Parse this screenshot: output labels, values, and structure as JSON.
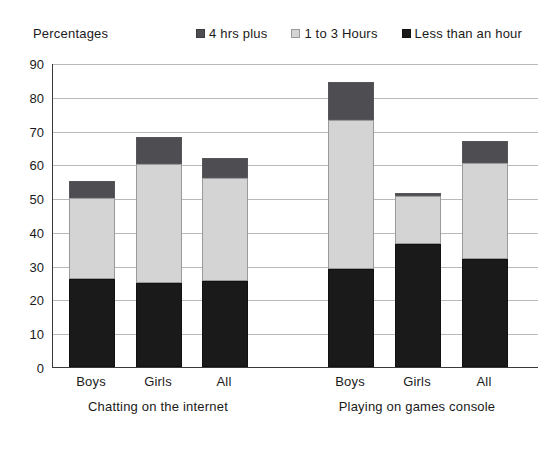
{
  "chart_data": {
    "type": "bar",
    "subtype": "stacked-bar",
    "title": "",
    "ylabel": "Percentages",
    "xlabel": "",
    "ylim": [
      0,
      90
    ],
    "ytick_step": 10,
    "yticks": [
      "90",
      "80",
      "70",
      "60",
      "50",
      "40",
      "30",
      "20",
      "10",
      "0"
    ],
    "grid": true,
    "legend_position": "top-right",
    "legend": [
      "4 hrs plus",
      "1 to 3 Hours",
      "Less than an hour"
    ],
    "categories": [
      "Boys",
      "Girls",
      "All",
      "Boys",
      "Girls",
      "All"
    ],
    "groups": [
      {
        "label": "Chatting on the internet",
        "categories": [
          "Boys",
          "Girls",
          "All"
        ]
      },
      {
        "label": "Playing on games console",
        "categories": [
          "Boys",
          "Girls",
          "All"
        ]
      }
    ],
    "series": [
      {
        "name": "Less than an hour",
        "color": "#1a1a1a",
        "values": [
          26,
          25,
          25.5,
          29,
          36.5,
          32
        ]
      },
      {
        "name": "1 to 3 Hours",
        "color": "#d4d4d4",
        "values": [
          24,
          35,
          30.5,
          44,
          14,
          28.5
        ]
      },
      {
        "name": "4 hrs plus",
        "color": "#4d4d52",
        "values": [
          5,
          8,
          6,
          11.5,
          1,
          6.5
        ]
      }
    ],
    "totals": [
      55,
      68,
      62,
      84.5,
      51.5,
      67
    ],
    "colors": {
      "series_4hrs": "#4d4d52",
      "series_1to3": "#d4d4d4",
      "series_lessthan": "#1a1a1a",
      "gridline": "#b9b9b9",
      "axis": "#3a3a3a",
      "background": "#ffffff"
    },
    "bars": [
      {
        "category": "Boys",
        "group": "Chatting on the internet",
        "less_than_an_hour": 26,
        "one_to_three_hours": 24,
        "four_hrs_plus": 5,
        "total": 55
      },
      {
        "category": "Girls",
        "group": "Chatting on the internet",
        "less_than_an_hour": 25,
        "one_to_three_hours": 35,
        "four_hrs_plus": 8,
        "total": 68
      },
      {
        "category": "All",
        "group": "Chatting on the internet",
        "less_than_an_hour": 25.5,
        "one_to_three_hours": 30.5,
        "four_hrs_plus": 6,
        "total": 62
      },
      {
        "category": "Boys",
        "group": "Playing on games console",
        "less_than_an_hour": 29,
        "one_to_three_hours": 44,
        "four_hrs_plus": 11.5,
        "total": 84.5
      },
      {
        "category": "Girls",
        "group": "Playing on games console",
        "less_than_an_hour": 36.5,
        "one_to_three_hours": 14,
        "four_hrs_plus": 1,
        "total": 51.5
      },
      {
        "category": "All",
        "group": "Playing on games console",
        "less_than_an_hour": 32,
        "one_to_three_hours": 28.5,
        "four_hrs_plus": 6.5,
        "total": 67
      }
    ]
  }
}
